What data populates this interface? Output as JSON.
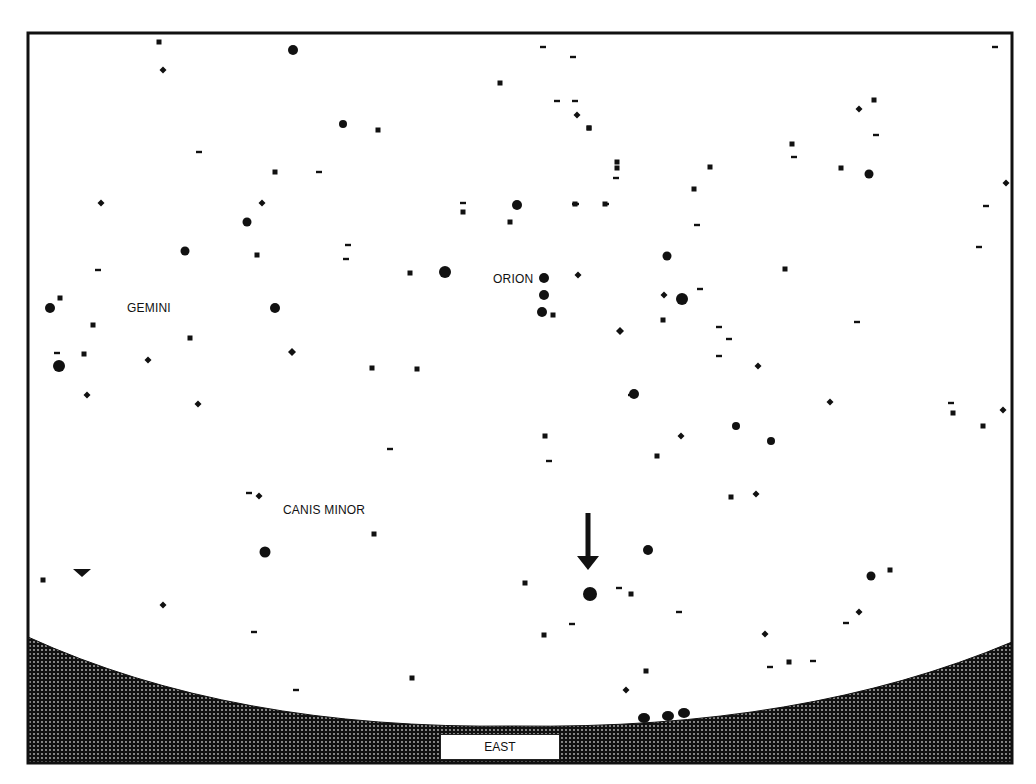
{
  "chart": {
    "frame": {
      "x": 28,
      "y": 33,
      "width": 984,
      "height": 730,
      "stroke": "#111111"
    },
    "colors": {
      "background": "#ffffff",
      "stars": "#111111",
      "ground": "#1a1a1a"
    },
    "constellation_labels": [
      {
        "text": "GEMINI",
        "x": 127,
        "y": 303
      },
      {
        "text": "ORION",
        "x": 493,
        "y": 274
      },
      {
        "text": "CANIS MINOR",
        "x": 283,
        "y": 505
      }
    ],
    "direction_label": "EAST",
    "marker": {
      "type": "arrow-down",
      "x": 588,
      "y1": 513,
      "y2": 570,
      "target_star": {
        "x": 590,
        "y": 594
      }
    },
    "triangle_marker": {
      "x": 82,
      "y": 572
    },
    "horizon": {
      "left_y": 637,
      "mid_y": 726,
      "right_y": 642,
      "bumps": [
        {
          "x": 644,
          "y": 718
        },
        {
          "x": 668,
          "y": 716
        },
        {
          "x": 684,
          "y": 713
        }
      ]
    },
    "stars": [
      {
        "x": 159,
        "y": 42,
        "r": 2.5,
        "shape": "sq"
      },
      {
        "x": 293,
        "y": 50,
        "r": 5,
        "shape": "dot"
      },
      {
        "x": 163,
        "y": 70,
        "r": 3.5,
        "shape": "dia"
      },
      {
        "x": 543,
        "y": 47,
        "r": 2,
        "shape": "dash"
      },
      {
        "x": 573,
        "y": 57,
        "r": 2,
        "shape": "dash"
      },
      {
        "x": 500,
        "y": 83,
        "r": 2.5,
        "shape": "sq"
      },
      {
        "x": 557,
        "y": 101,
        "r": 2,
        "shape": "dash"
      },
      {
        "x": 577,
        "y": 115,
        "r": 3.5,
        "shape": "dia"
      },
      {
        "x": 589,
        "y": 128,
        "r": 2.5,
        "shape": "sq"
      },
      {
        "x": 343,
        "y": 124,
        "r": 4,
        "shape": "dot"
      },
      {
        "x": 378,
        "y": 130,
        "r": 2.5,
        "shape": "sq"
      },
      {
        "x": 199,
        "y": 152,
        "r": 2,
        "shape": "dash"
      },
      {
        "x": 275,
        "y": 172,
        "r": 2.5,
        "shape": "sq"
      },
      {
        "x": 319,
        "y": 172,
        "r": 2,
        "shape": "dash"
      },
      {
        "x": 101,
        "y": 203,
        "r": 3.5,
        "shape": "dia"
      },
      {
        "x": 262,
        "y": 203,
        "r": 3.5,
        "shape": "dia"
      },
      {
        "x": 247,
        "y": 222,
        "r": 4.5,
        "shape": "dot"
      },
      {
        "x": 185,
        "y": 251,
        "r": 4.5,
        "shape": "dot"
      },
      {
        "x": 257,
        "y": 255,
        "r": 2.5,
        "shape": "sq"
      },
      {
        "x": 98,
        "y": 270,
        "r": 2,
        "shape": "dash"
      },
      {
        "x": 348,
        "y": 245,
        "r": 2,
        "shape": "dash"
      },
      {
        "x": 346,
        "y": 259,
        "r": 2,
        "shape": "dash"
      },
      {
        "x": 410,
        "y": 273,
        "r": 2.5,
        "shape": "sq"
      },
      {
        "x": 445,
        "y": 272,
        "r": 6,
        "shape": "dot"
      },
      {
        "x": 463,
        "y": 203,
        "r": 2,
        "shape": "dash"
      },
      {
        "x": 463,
        "y": 212,
        "r": 2.5,
        "shape": "sq"
      },
      {
        "x": 510,
        "y": 222,
        "r": 2.5,
        "shape": "sq"
      },
      {
        "x": 517,
        "y": 205,
        "r": 5,
        "shape": "dot"
      },
      {
        "x": 576,
        "y": 204,
        "r": 2,
        "shape": "dash"
      },
      {
        "x": 50,
        "y": 308,
        "r": 5,
        "shape": "dot"
      },
      {
        "x": 60,
        "y": 298,
        "r": 2.5,
        "shape": "sq"
      },
      {
        "x": 93,
        "y": 325,
        "r": 2.5,
        "shape": "sq"
      },
      {
        "x": 190,
        "y": 338,
        "r": 2.5,
        "shape": "sq"
      },
      {
        "x": 275,
        "y": 308,
        "r": 5,
        "shape": "dot"
      },
      {
        "x": 57,
        "y": 353,
        "r": 2,
        "shape": "dash"
      },
      {
        "x": 84,
        "y": 354,
        "r": 2.5,
        "shape": "sq"
      },
      {
        "x": 59,
        "y": 366,
        "r": 6,
        "shape": "dot"
      },
      {
        "x": 148,
        "y": 360,
        "r": 3.5,
        "shape": "dia"
      },
      {
        "x": 292,
        "y": 352,
        "r": 4,
        "shape": "dia"
      },
      {
        "x": 372,
        "y": 368,
        "r": 2.5,
        "shape": "sq"
      },
      {
        "x": 417,
        "y": 369,
        "r": 2.5,
        "shape": "sq"
      },
      {
        "x": 87,
        "y": 395,
        "r": 3.5,
        "shape": "dia"
      },
      {
        "x": 198,
        "y": 404,
        "r": 3.5,
        "shape": "dia"
      },
      {
        "x": 544,
        "y": 278,
        "r": 5,
        "shape": "dot"
      },
      {
        "x": 544,
        "y": 295,
        "r": 5,
        "shape": "dot"
      },
      {
        "x": 542,
        "y": 312,
        "r": 5,
        "shape": "dot"
      },
      {
        "x": 553,
        "y": 315,
        "r": 2.5,
        "shape": "sq"
      },
      {
        "x": 578,
        "y": 275,
        "r": 3.5,
        "shape": "dia"
      },
      {
        "x": 620,
        "y": 331,
        "r": 4,
        "shape": "dia"
      },
      {
        "x": 617,
        "y": 162,
        "r": 2.5,
        "shape": "sq"
      },
      {
        "x": 616,
        "y": 178,
        "r": 2,
        "shape": "dash"
      },
      {
        "x": 606,
        "y": 204,
        "r": 2,
        "shape": "dash"
      },
      {
        "x": 575,
        "y": 204,
        "r": 2,
        "shape": "dash"
      },
      {
        "x": 605,
        "y": 204,
        "r": 2.5,
        "shape": "sq"
      },
      {
        "x": 575,
        "y": 204,
        "r": 2.5,
        "shape": "sq"
      },
      {
        "x": 617,
        "y": 168,
        "r": 2.5,
        "shape": "sq"
      },
      {
        "x": 667,
        "y": 256,
        "r": 4.5,
        "shape": "dot"
      },
      {
        "x": 575,
        "y": 101,
        "r": 2,
        "shape": "dash"
      },
      {
        "x": 589,
        "y": 128,
        "r": 2.5,
        "shape": "sq"
      },
      {
        "x": 664,
        "y": 295,
        "r": 3.5,
        "shape": "dia"
      },
      {
        "x": 682,
        "y": 299,
        "r": 6,
        "shape": "dot"
      },
      {
        "x": 700,
        "y": 289,
        "r": 2,
        "shape": "dash"
      },
      {
        "x": 663,
        "y": 320,
        "r": 2.5,
        "shape": "sq"
      },
      {
        "x": 697,
        "y": 225,
        "r": 2,
        "shape": "dash"
      },
      {
        "x": 694,
        "y": 189,
        "r": 2.5,
        "shape": "sq"
      },
      {
        "x": 710,
        "y": 167,
        "r": 2.5,
        "shape": "sq"
      },
      {
        "x": 719,
        "y": 327,
        "r": 2,
        "shape": "dash"
      },
      {
        "x": 729,
        "y": 339,
        "r": 2,
        "shape": "dash"
      },
      {
        "x": 719,
        "y": 356,
        "r": 2,
        "shape": "dash"
      },
      {
        "x": 758,
        "y": 366,
        "r": 3.5,
        "shape": "dia"
      },
      {
        "x": 634,
        "y": 394,
        "r": 5,
        "shape": "dot"
      },
      {
        "x": 785,
        "y": 269,
        "r": 2.5,
        "shape": "sq"
      },
      {
        "x": 792,
        "y": 144,
        "r": 2.5,
        "shape": "sq"
      },
      {
        "x": 794,
        "y": 157,
        "r": 2,
        "shape": "dash"
      },
      {
        "x": 841,
        "y": 168,
        "r": 2.5,
        "shape": "sq"
      },
      {
        "x": 874,
        "y": 100,
        "r": 2.5,
        "shape": "sq"
      },
      {
        "x": 859,
        "y": 109,
        "r": 3.5,
        "shape": "dia"
      },
      {
        "x": 876,
        "y": 135,
        "r": 2,
        "shape": "dash"
      },
      {
        "x": 869,
        "y": 174,
        "r": 4.5,
        "shape": "dot"
      },
      {
        "x": 857,
        "y": 322,
        "r": 2,
        "shape": "dash"
      },
      {
        "x": 995,
        "y": 47,
        "r": 2,
        "shape": "dash"
      },
      {
        "x": 1006,
        "y": 183,
        "r": 3.5,
        "shape": "dia"
      },
      {
        "x": 986,
        "y": 206,
        "r": 2,
        "shape": "dash"
      },
      {
        "x": 979,
        "y": 247,
        "r": 2,
        "shape": "dash"
      },
      {
        "x": 830,
        "y": 402,
        "r": 3.5,
        "shape": "dia"
      },
      {
        "x": 545,
        "y": 436,
        "r": 2.5,
        "shape": "sq"
      },
      {
        "x": 549,
        "y": 461,
        "r": 2,
        "shape": "dash"
      },
      {
        "x": 390,
        "y": 449,
        "r": 2,
        "shape": "dash"
      },
      {
        "x": 631,
        "y": 395,
        "r": 2,
        "shape": "dash"
      },
      {
        "x": 657,
        "y": 456,
        "r": 2.5,
        "shape": "sq"
      },
      {
        "x": 681,
        "y": 436,
        "r": 3.5,
        "shape": "dia"
      },
      {
        "x": 736,
        "y": 426,
        "r": 4,
        "shape": "dot"
      },
      {
        "x": 771,
        "y": 441,
        "r": 4,
        "shape": "dot"
      },
      {
        "x": 731,
        "y": 497,
        "r": 2.5,
        "shape": "sq"
      },
      {
        "x": 756,
        "y": 494,
        "r": 3.5,
        "shape": "dia"
      },
      {
        "x": 951,
        "y": 403,
        "r": 2,
        "shape": "dash"
      },
      {
        "x": 953,
        "y": 413,
        "r": 2.5,
        "shape": "sq"
      },
      {
        "x": 1003,
        "y": 410,
        "r": 3.5,
        "shape": "dia"
      },
      {
        "x": 983,
        "y": 426,
        "r": 2.5,
        "shape": "sq"
      },
      {
        "x": 249,
        "y": 493,
        "r": 2,
        "shape": "dash"
      },
      {
        "x": 259,
        "y": 496,
        "r": 3.5,
        "shape": "dia"
      },
      {
        "x": 374,
        "y": 534,
        "r": 2.5,
        "shape": "sq"
      },
      {
        "x": 265,
        "y": 552,
        "r": 5.5,
        "shape": "dot"
      },
      {
        "x": 43,
        "y": 580,
        "r": 2.5,
        "shape": "sq"
      },
      {
        "x": 163,
        "y": 605,
        "r": 3.5,
        "shape": "dia"
      },
      {
        "x": 254,
        "y": 632,
        "r": 2,
        "shape": "dash"
      },
      {
        "x": 412,
        "y": 678,
        "r": 2.5,
        "shape": "sq"
      },
      {
        "x": 296,
        "y": 690,
        "r": 2,
        "shape": "dash"
      },
      {
        "x": 648,
        "y": 550,
        "r": 5,
        "shape": "dot"
      },
      {
        "x": 525,
        "y": 583,
        "r": 2.5,
        "shape": "sq"
      },
      {
        "x": 590,
        "y": 594,
        "r": 7,
        "shape": "dot"
      },
      {
        "x": 619,
        "y": 588,
        "r": 2,
        "shape": "dash"
      },
      {
        "x": 631,
        "y": 594,
        "r": 2.5,
        "shape": "sq"
      },
      {
        "x": 679,
        "y": 612,
        "r": 2,
        "shape": "dash"
      },
      {
        "x": 572,
        "y": 624,
        "r": 2,
        "shape": "dash"
      },
      {
        "x": 544,
        "y": 635,
        "r": 2.5,
        "shape": "sq"
      },
      {
        "x": 765,
        "y": 634,
        "r": 3.5,
        "shape": "dia"
      },
      {
        "x": 646,
        "y": 671,
        "r": 2.5,
        "shape": "sq"
      },
      {
        "x": 626,
        "y": 690,
        "r": 3.5,
        "shape": "dia"
      },
      {
        "x": 871,
        "y": 576,
        "r": 4.5,
        "shape": "dot"
      },
      {
        "x": 890,
        "y": 570,
        "r": 2.5,
        "shape": "sq"
      },
      {
        "x": 859,
        "y": 612,
        "r": 3.5,
        "shape": "dia"
      },
      {
        "x": 846,
        "y": 623,
        "r": 2,
        "shape": "dash"
      },
      {
        "x": 770,
        "y": 667,
        "r": 2,
        "shape": "dash"
      },
      {
        "x": 789,
        "y": 662,
        "r": 2.5,
        "shape": "sq"
      },
      {
        "x": 813,
        "y": 661,
        "r": 2,
        "shape": "dash"
      }
    ]
  }
}
